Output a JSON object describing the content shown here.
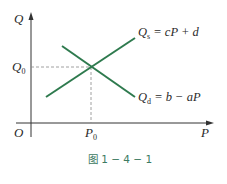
{
  "diagram": {
    "type": "supply-demand",
    "axes": {
      "y_label": "Q",
      "x_label": "P",
      "origin_label": "O"
    },
    "equilibrium": {
      "q_label": "Q",
      "q_sub": "0",
      "p_label": "P",
      "p_sub": "0"
    },
    "supply": {
      "name": "Q",
      "sub": "s",
      "equation": "= cP + d"
    },
    "demand": {
      "name": "Q",
      "sub": "d",
      "equation": "= b − aP"
    },
    "colors": {
      "lines": "#2e7a4e",
      "axes": "#333333",
      "guides": "#888888",
      "caption": "#3d7a62"
    },
    "caption": "图 1 − 4 − 1"
  }
}
